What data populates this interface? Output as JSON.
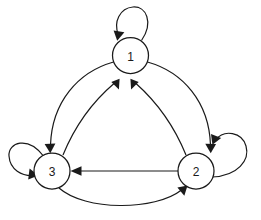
{
  "diagram": {
    "type": "state-transition-diagram",
    "title": "",
    "background_color": "#ffffff",
    "stroke_color": "#1a1a1a",
    "node_fill_color": "#ffffff",
    "node_radius": 18,
    "nodes": [
      {
        "id": "1",
        "label": "1",
        "cx": 130.5,
        "cy": 55.5
      },
      {
        "id": "3",
        "label": "3",
        "cx": 52.0,
        "cy": 171.0
      },
      {
        "id": "2",
        "label": "2",
        "cx": 196.0,
        "cy": 171.0
      }
    ],
    "edges": [
      {
        "id": "e-1-1",
        "from": "1",
        "to": "1",
        "kind": "self-loop",
        "label": ""
      },
      {
        "id": "e-3-3",
        "from": "3",
        "to": "3",
        "kind": "self-loop",
        "label": ""
      },
      {
        "id": "e-2-2",
        "from": "2",
        "to": "2",
        "kind": "self-loop",
        "label": ""
      },
      {
        "id": "e-1-3",
        "from": "1",
        "to": "3",
        "kind": "curve-outer-left",
        "label": ""
      },
      {
        "id": "e-3-1",
        "from": "3",
        "to": "1",
        "kind": "curve-inner-left",
        "label": ""
      },
      {
        "id": "e-1-2",
        "from": "1",
        "to": "2",
        "kind": "curve-outer-right",
        "label": ""
      },
      {
        "id": "e-2-1",
        "from": "2",
        "to": "1",
        "kind": "curve-inner-right",
        "label": ""
      },
      {
        "id": "e-2-3",
        "from": "2",
        "to": "3",
        "kind": "straight",
        "label": ""
      },
      {
        "id": "e-3-2",
        "from": "3",
        "to": "2",
        "kind": "curve-bottom",
        "label": ""
      }
    ]
  }
}
